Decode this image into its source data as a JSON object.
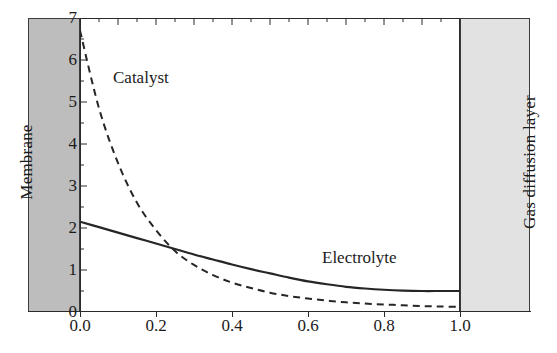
{
  "figure": {
    "regions": {
      "membrane": {
        "label": "Membrane",
        "color": "#bdbdbd"
      },
      "gas_diffusion_layer": {
        "label": "Gas diffusion layer",
        "color": "#e2e2e2"
      }
    },
    "curve_labels": {
      "catalyst": "Catalyst",
      "electrolyte": "Electrolyte"
    }
  },
  "axes": {
    "y_ticks": [
      "0",
      "1",
      "2",
      "3",
      "4",
      "5",
      "6",
      "7"
    ],
    "x_ticks": [
      "0.0",
      "0.2",
      "0.4",
      "0.6",
      "0.8",
      "1.0"
    ]
  },
  "chart_data": {
    "type": "line",
    "title": "",
    "xlabel": "",
    "ylabel": "",
    "xlim": [
      0.0,
      1.0
    ],
    "ylim": [
      0,
      7
    ],
    "grid": false,
    "legend": "inline-annotations",
    "xticks": [
      0.0,
      0.2,
      0.4,
      0.6,
      0.8,
      1.0
    ],
    "yticks": [
      0,
      1,
      2,
      3,
      4,
      5,
      6,
      7
    ],
    "x": [
      0.0,
      0.05,
      0.1,
      0.15,
      0.2,
      0.25,
      0.3,
      0.35,
      0.4,
      0.45,
      0.5,
      0.55,
      0.6,
      0.65,
      0.7,
      0.75,
      0.8,
      0.85,
      0.9,
      0.95,
      1.0
    ],
    "series": [
      {
        "name": "Catalyst",
        "style": "dashed",
        "color": "#262626",
        "values": [
          6.7,
          4.85,
          3.55,
          2.6,
          1.95,
          1.45,
          1.12,
          0.88,
          0.7,
          0.57,
          0.46,
          0.38,
          0.32,
          0.27,
          0.23,
          0.2,
          0.18,
          0.16,
          0.14,
          0.13,
          0.12
        ]
      },
      {
        "name": "Electrolyte",
        "style": "solid",
        "color": "#262626",
        "values": [
          2.15,
          2.02,
          1.89,
          1.76,
          1.63,
          1.5,
          1.37,
          1.25,
          1.13,
          1.02,
          0.92,
          0.82,
          0.73,
          0.66,
          0.6,
          0.56,
          0.53,
          0.51,
          0.5,
          0.5,
          0.5
        ]
      }
    ],
    "annotations": [
      {
        "text": "Catalyst",
        "x": 0.09,
        "y": 5.7
      },
      {
        "text": "Electrolyte",
        "x": 0.64,
        "y": 1.25
      },
      {
        "text": "Membrane",
        "x": -0.13,
        "y": 3.5
      },
      {
        "text": "Gas diffusion layer",
        "x": 1.13,
        "y": 3.5
      }
    ]
  }
}
